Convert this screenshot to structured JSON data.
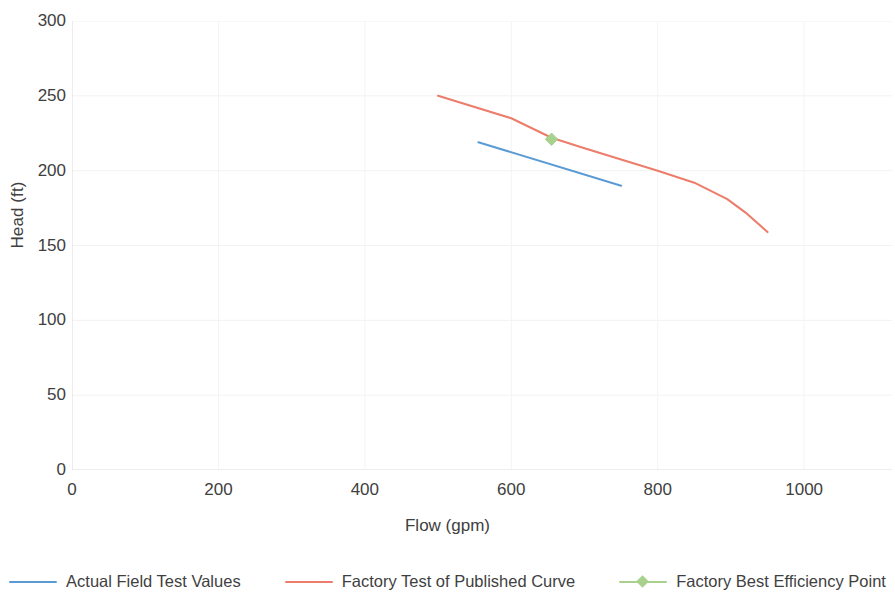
{
  "chart_data": {
    "type": "line",
    "title": "",
    "xlabel": "Flow (gpm)",
    "ylabel": "Head (ft)",
    "xlim": [
      0,
      1120
    ],
    "ylim": [
      0,
      300
    ],
    "xticks": [
      0,
      200,
      400,
      600,
      800,
      1000
    ],
    "yticks": [
      0,
      50,
      100,
      150,
      200,
      250,
      300
    ],
    "xtick_labels": [
      "0",
      "200",
      "400",
      "600",
      "800",
      "1000"
    ],
    "ytick_labels": [
      "0",
      "50",
      "100",
      "150",
      "200",
      "250",
      "300"
    ],
    "grid": "faint-light-gray",
    "legend_position": "bottom",
    "series": [
      {
        "name": "Actual Field Test Values",
        "type": "line",
        "color": "#5B9BD5",
        "marker": "none",
        "x": [
          555,
          750
        ],
        "y": [
          219,
          190
        ]
      },
      {
        "name": "Factory Test of Published Curve",
        "type": "line",
        "color": "#ED7D6B",
        "marker": "none",
        "x": [
          500,
          600,
          655,
          700,
          800,
          850,
          895,
          920,
          950
        ],
        "y": [
          250,
          235,
          222,
          215,
          200,
          192,
          181,
          172,
          159
        ]
      },
      {
        "name": "Factory Best Efficiency Point",
        "type": "scatter",
        "color": "#A9D18E",
        "marker": "diamond",
        "x": [
          655
        ],
        "y": [
          221
        ]
      }
    ]
  },
  "legend": {
    "items": [
      {
        "label": "Actual Field Test Values",
        "color": "#5B9BD5",
        "marker": "none"
      },
      {
        "label": "Factory Test of Published Curve",
        "color": "#ED7D6B",
        "marker": "none"
      },
      {
        "label": "Factory Best Efficiency Point",
        "color": "#A9D18E",
        "marker": "diamond"
      }
    ]
  },
  "axes": {
    "x_title": "Flow (gpm)",
    "y_title": "Head (ft)"
  }
}
